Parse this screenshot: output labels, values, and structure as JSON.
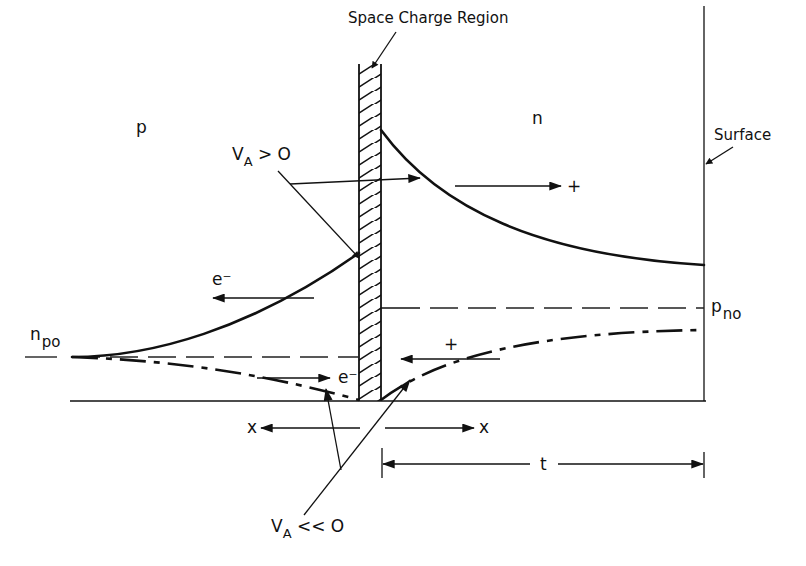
{
  "diagram": {
    "title_label": "Space Charge Region",
    "region_p_label": "p",
    "region_n_label": "n",
    "surface_label": "Surface",
    "npo_label": {
      "main": "n",
      "sub": "po"
    },
    "pno_label": {
      "main": "p",
      "sub": "no"
    },
    "forward_bias_label": {
      "main": "V",
      "sub": "A",
      "rest": " > O"
    },
    "reverse_bias_label": {
      "main": "V",
      "sub": "A",
      "rest": " << O"
    },
    "electron_label_upper": "e⁻",
    "electron_label_lower": "e⁻",
    "hole_label_upper": "+",
    "hole_label_lower": "+",
    "x_left_label": "x",
    "x_right_label": "x",
    "thickness_label": "t",
    "colors": {
      "ink": "#111111",
      "background": "#ffffff"
    }
  }
}
